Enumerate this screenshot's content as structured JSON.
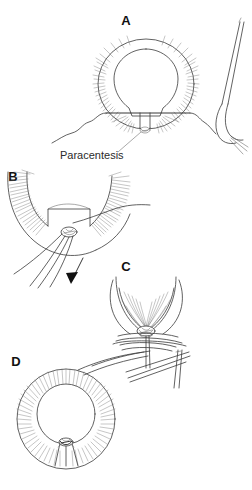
{
  "figure": {
    "background_color": "#ffffff",
    "line_color": "#3a3a3a",
    "label_color": "#111111",
    "annotation_color": "#2b2b2b",
    "width": 252,
    "height": 490
  },
  "panels": [
    {
      "id": "A",
      "label": "A",
      "label_x": 126,
      "label_y": 25,
      "caption": "En face view of the annulus with radial striations; a horizontal suture is passed across the inferior opening while a needle holder approaches from the right",
      "annotations": [
        {
          "name": "paracentesis",
          "text": "Paracentesis",
          "x": 60,
          "y": 159
        }
      ]
    },
    {
      "id": "B",
      "label": "B",
      "label_x": 13,
      "label_y": 181,
      "caption": "Magnified inferior segment showing the suture ends grasped and drawn downward under traction",
      "annotations": []
    },
    {
      "id": "C",
      "label": "C",
      "label_x": 126,
      "label_y": 271,
      "caption": "Close-up of the suture throws being tied down into a knot at the wound apex",
      "annotations": []
    },
    {
      "id": "D",
      "label": "D",
      "label_x": 16,
      "label_y": 366,
      "caption": "Final en face appearance with the wound closed and the knot buried inferiorly",
      "annotations": []
    }
  ],
  "icons": {
    "traction_arrow": "arrow-down-left-icon"
  }
}
